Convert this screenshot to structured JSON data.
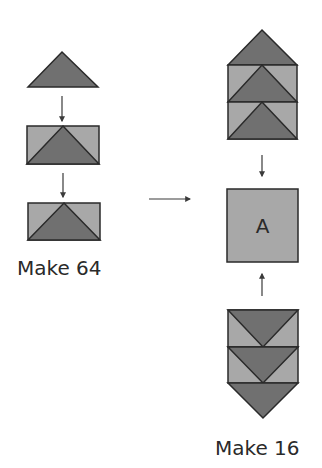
{
  "diagram": {
    "colors": {
      "dark_fill": "#707070",
      "light_fill": "#a8a8a8",
      "square_fill": "#a8a8a8",
      "stroke": "#2a2a2a",
      "arrow": "#3a3a3a"
    },
    "left_column": {
      "caption": "Make 64",
      "steps": [
        "triangle",
        "arrow-down",
        "flying-geese-unit",
        "arrow-down",
        "flying-geese-unit"
      ]
    },
    "connector_arrow": "arrow-right",
    "right_column": {
      "square_label": "A",
      "caption": "Make 16",
      "top_stack": [
        "triangle",
        "flying-geese-unit",
        "flying-geese-unit"
      ],
      "bottom_stack": [
        "flying-geese-unit-inverted",
        "flying-geese-unit-inverted",
        "triangle-inverted"
      ]
    }
  }
}
